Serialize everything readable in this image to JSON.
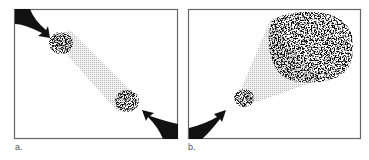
{
  "figure": {
    "panels": [
      {
        "id": "a",
        "label": "a.",
        "description": "Two small particle clusters at opposite corners connected by a shaded beam, arrows pointing inward"
      },
      {
        "id": "b",
        "label": "b.",
        "description": "Small particle cluster at lower-left expanding via shaded cone into large particle cloud at upper-right, arrow pointing inward"
      }
    ],
    "colors": {
      "ink": "#111111",
      "border": "#666666",
      "beam": "#c8c8c8"
    }
  }
}
